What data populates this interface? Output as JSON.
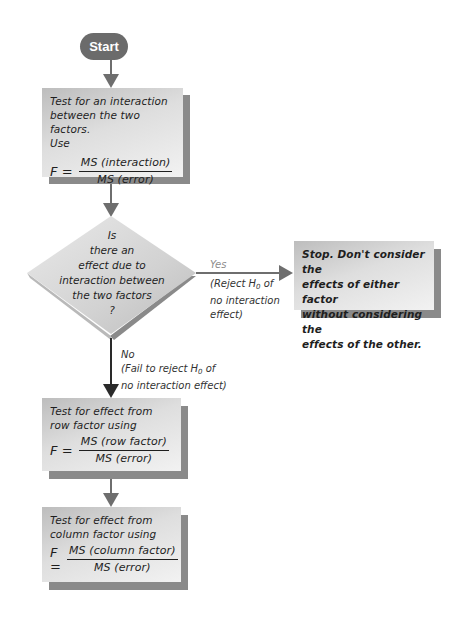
{
  "start": {
    "label": "Start"
  },
  "box_interaction": {
    "line1_pre": "Test for an ",
    "line1_em": "interaction",
    "line2": "between the two factors.",
    "line3": "Use",
    "formula_lhs": "F =",
    "numerator": "MS (interaction)",
    "denominator": "MS (error)"
  },
  "decision": {
    "lines": [
      "Is",
      "there an",
      "effect due to",
      "interaction between",
      "the two factors",
      "?"
    ]
  },
  "yes_branch": {
    "label": "Yes",
    "note_line1_pre": "(Reject ",
    "note_h": "H",
    "note_sub": "0",
    "note_line1_post": " of",
    "note_line2": "no interaction",
    "note_line3": "effect)"
  },
  "stop_box": {
    "lines": [
      "Stop. Don't consider the",
      "effects of either factor",
      "without considering the",
      "effects of the other."
    ]
  },
  "no_branch": {
    "label": "No",
    "note_line1_pre": "(Fail to reject ",
    "note_h": "H",
    "note_sub": "0",
    "note_line1_post": " of",
    "note_line2": "no interaction effect)"
  },
  "box_row": {
    "line1": "Test for effect from",
    "line2": "row factor using",
    "formula_lhs": "F =",
    "numerator": "MS (row factor)",
    "denominator": "MS (error)"
  },
  "box_column": {
    "line1": "Test for effect from",
    "line2": "column factor using",
    "formula_lhs": "F =",
    "numerator": "MS (column factor)",
    "denominator": "MS (error)"
  },
  "colors": {
    "start_fill": "#6b6b6b",
    "box_shadow": "#8a8a8a",
    "arrow": "#6e6e6e",
    "no_arrow": "#2a2a2a",
    "yes_label": "#8c8c8c"
  }
}
